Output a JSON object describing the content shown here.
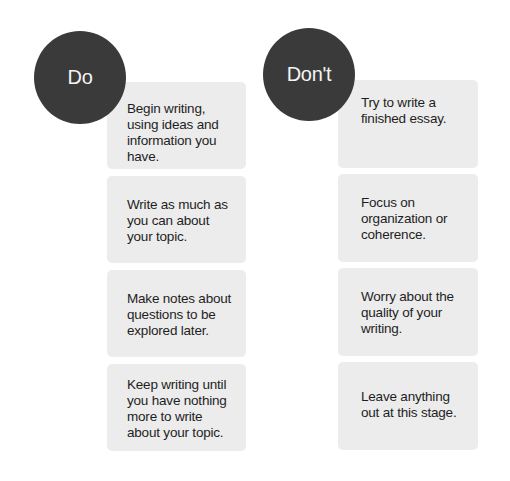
{
  "do": {
    "heading": "Do",
    "items": [
      "Begin writing,\nusing ideas and\ninformation you\nhave.",
      "Write as much as\nyou can about\nyour topic.",
      "Make notes about\nquestions to be\nexplored later.",
      "Keep writing until\nyou have nothing\nmore to write\nabout your topic."
    ]
  },
  "dont": {
    "heading": "Don't",
    "items": [
      "Try to write a\nfinished essay.",
      "Focus on\norganization or\ncoherence.",
      "Worry about the\nquality of your\nwriting.",
      "Leave anything\nout at this stage."
    ]
  },
  "colors": {
    "circle": "#3a3a3a",
    "circle_text": "#f4f4f4",
    "box": "#ececec",
    "box_text": "#1e1e1e"
  }
}
